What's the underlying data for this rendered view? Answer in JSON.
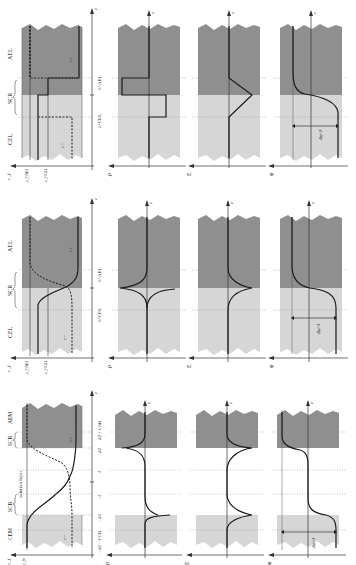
{
  "figure": {
    "orientation": "rotated-90-ccw",
    "colors": {
      "dark_region": "#8f8f8f",
      "light_region": "#d6d6d6",
      "line": "#1a1a1a",
      "guide": "#9a9a9a",
      "background": "#ffffff"
    },
    "axis_z_label": "z",
    "panel_ylabels": [
      "c",
      "ρ",
      "E",
      "φ"
    ],
    "rows": [
      {
        "id": "row-a",
        "region_labels": {
          "left": "CEL",
          "middle": "SCR",
          "right": "AEL"
        },
        "tick_labels": [
          "λ^CEL",
          "λ^AEL"
        ],
        "conc_labels": {
          "c_axis": "c_f",
          "ref_left": "c_f^AEL",
          "ref_right": "c_f^CEL",
          "curve_minus": "c−",
          "curve_plus": "c+"
        },
        "potential_drop": "Δφ^J"
      },
      {
        "id": "row-b",
        "region_labels": {
          "left": "CEL",
          "middle": "SCR",
          "right": "AEL"
        },
        "tick_labels": [
          "λ^CEL",
          "λ^AEL"
        ],
        "conc_labels": {
          "c_axis": "c_f",
          "ref_left": "c_f^AEL",
          "ref_right": "c_f^CEL",
          "curve_minus": "c−",
          "curve_plus": "c+"
        },
        "potential_drop": "Δφ^J"
      },
      {
        "id": "row-c",
        "region_labels": {
          "left": "CEM",
          "scr_left": "SCR",
          "middle": "solution layer",
          "scr_right": "SCR",
          "right": "AEM"
        },
        "tick_labels": [
          "−d/2 − λ^CEL",
          "−d/2",
          "−Λ",
          "Λ",
          "d/2",
          "d/2 + λ^AEL"
        ],
        "conc_labels": {
          "c_axis": "c_f",
          "ref_left": "c_fn",
          "curve_minus": "c−",
          "curve_plus": "c+"
        },
        "potential_drop": "Δφ^J"
      }
    ]
  }
}
